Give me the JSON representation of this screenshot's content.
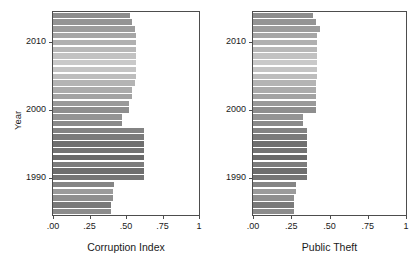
{
  "figure": {
    "type": "paired-horizontal-bar",
    "background": "#ffffff",
    "frame_color": "#4d4d4d"
  },
  "chart_data": [
    {
      "type": "bar",
      "orientation": "horizontal",
      "title": "",
      "xlabel": "Corruption Index",
      "ylabel": "Year",
      "xlim": [
        0,
        1
      ],
      "ylim": [
        1984.5,
        2014.5
      ],
      "grid": false,
      "legend": null,
      "xticks": [
        0,
        0.25,
        0.5,
        0.75,
        1
      ],
      "xticklabels": [
        ".00",
        ".25",
        ".50",
        ".75",
        "1"
      ],
      "yticks": [
        1990,
        2000,
        2010
      ],
      "yticklabels": [
        "1990",
        "2000",
        "2010"
      ],
      "categories": [
        1985,
        1986,
        1987,
        1988,
        1989,
        1990,
        1991,
        1992,
        1993,
        1994,
        1995,
        1996,
        1997,
        1998,
        1999,
        2000,
        2001,
        2002,
        2003,
        2004,
        2005,
        2006,
        2007,
        2008,
        2009,
        2010,
        2011,
        2012,
        2013,
        2014
      ],
      "values": [
        0.4,
        0.4,
        0.41,
        0.41,
        0.42,
        0.62,
        0.62,
        0.62,
        0.62,
        0.62,
        0.62,
        0.62,
        0.62,
        0.47,
        0.47,
        0.52,
        0.52,
        0.54,
        0.54,
        0.56,
        0.57,
        0.57,
        0.57,
        0.57,
        0.57,
        0.57,
        0.57,
        0.56,
        0.54,
        0.53
      ],
      "bar_colors": [
        "#8c8c8c",
        "#7a7a7a",
        "#8f8f8f",
        "#9b9b9b",
        "#858585",
        "#757575",
        "#6e6e6e",
        "#7c7c7c",
        "#6a6a6a",
        "#737373",
        "#6f6f6f",
        "#7b7b7b",
        "#838383",
        "#8a8a8a",
        "#949494",
        "#8e8e8e",
        "#999999",
        "#a3a3a3",
        "#ababab",
        "#b4b4b4",
        "#bdbdbd",
        "#c4c4c4",
        "#c9c9c9",
        "#c2c2c2",
        "#b8b8b8",
        "#b0b0b0",
        "#a6a6a6",
        "#9c9c9c",
        "#949494",
        "#8d8d8d"
      ]
    },
    {
      "type": "bar",
      "orientation": "horizontal",
      "title": "",
      "xlabel": "Public Theft",
      "ylabel": "",
      "xlim": [
        0,
        1
      ],
      "ylim": [
        1984.5,
        2014.5
      ],
      "grid": false,
      "legend": null,
      "xticks": [
        0,
        0.25,
        0.5,
        0.75,
        1
      ],
      "xticklabels": [
        ".00",
        ".25",
        ".50",
        ".75",
        "1"
      ],
      "yticks": [
        1990,
        2000,
        2010
      ],
      "yticklabels": [
        "1990",
        "2000",
        "2010"
      ],
      "categories": [
        1985,
        1986,
        1987,
        1988,
        1989,
        1990,
        1991,
        1992,
        1993,
        1994,
        1995,
        1996,
        1997,
        1998,
        1999,
        2000,
        2001,
        2002,
        2003,
        2004,
        2005,
        2006,
        2007,
        2008,
        2009,
        2010,
        2011,
        2012,
        2013,
        2014
      ],
      "values": [
        0.27,
        0.27,
        0.27,
        0.28,
        0.28,
        0.35,
        0.35,
        0.35,
        0.35,
        0.35,
        0.35,
        0.35,
        0.35,
        0.33,
        0.33,
        0.41,
        0.41,
        0.41,
        0.41,
        0.41,
        0.42,
        0.42,
        0.42,
        0.42,
        0.42,
        0.42,
        0.42,
        0.44,
        0.41,
        0.39
      ],
      "bar_colors": [
        "#8c8c8c",
        "#7a7a7a",
        "#8f8f8f",
        "#9b9b9b",
        "#858585",
        "#757575",
        "#6e6e6e",
        "#7c7c7c",
        "#6a6a6a",
        "#737373",
        "#6f6f6f",
        "#7b7b7b",
        "#838383",
        "#8a8a8a",
        "#949494",
        "#8e8e8e",
        "#999999",
        "#a3a3a3",
        "#ababab",
        "#b4b4b4",
        "#bdbdbd",
        "#c4c4c4",
        "#c9c9c9",
        "#c2c2c2",
        "#b8b8b8",
        "#b0b0b0",
        "#a6a6a6",
        "#9c9c9c",
        "#949494",
        "#8d8d8d"
      ]
    }
  ]
}
